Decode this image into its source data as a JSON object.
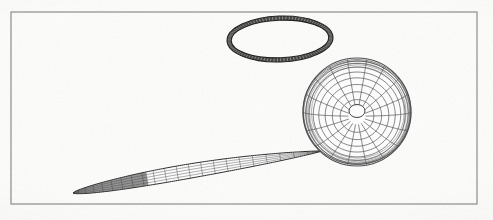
{
  "figure": {
    "description": "Scanned line drawing showing three wireframe bodies inside a thin rectangular border: a thin dark elliptical ring above, a meshed sphere with polar hole at right, and a slender lens/needle shaped body extending to the lower left.",
    "background_color": "#fdfdfb",
    "ink_color": "#3a3a3a",
    "width": 493,
    "height": 220
  },
  "border": {
    "name": "figure-border",
    "x": 11,
    "y": 12,
    "width": 466,
    "height": 192,
    "stroke": "#8c8c8c",
    "stroke_width": 1.2
  },
  "objects": {
    "ring": {
      "label": "elliptical ring",
      "center_x": 280,
      "center_y": 39,
      "rx": 53,
      "ry": 23,
      "band_thickness": 4.2,
      "rotation_deg": -2,
      "stroke": "#1b1b1b",
      "hatch_count": 96
    },
    "sphere": {
      "label": "meshed sphere",
      "center_x": 357,
      "center_y": 112,
      "radius": 54,
      "tilt_deg": -14,
      "meridians": 18,
      "parallels": 9,
      "pole_hole_rx": 8,
      "pole_hole_ry": 6.5,
      "stroke": "#444444"
    },
    "needle": {
      "label": "lens body",
      "tip_x": 73,
      "tip_y": 193,
      "root_x": 322,
      "root_y": 151,
      "max_half_thickness": 9.5,
      "ribs": 22,
      "chordlines": 5,
      "stroke": "#3b3b3b"
    }
  },
  "chart_data": {
    "type": "line",
    "xlabel": "",
    "ylabel": "",
    "xlim": [
      0,
      493
    ],
    "ylim": [
      0,
      220
    ],
    "grid": false,
    "legend": "none",
    "series": [
      {
        "name": "elliptical ring",
        "shape": "annulus",
        "center": [
          280,
          39
        ],
        "radii": [
          53,
          23
        ],
        "band_thickness": 4.2,
        "values": []
      },
      {
        "name": "meshed sphere",
        "shape": "sphere-wireframe",
        "center": [
          357,
          112
        ],
        "radius": 54,
        "meridians": 18,
        "parallels": 9,
        "values": []
      },
      {
        "name": "lens body",
        "shape": "slender-lens",
        "from": [
          73,
          193
        ],
        "to": [
          322,
          151
        ],
        "max_half_thickness": 9.5,
        "ribs": 22,
        "values": []
      }
    ]
  }
}
